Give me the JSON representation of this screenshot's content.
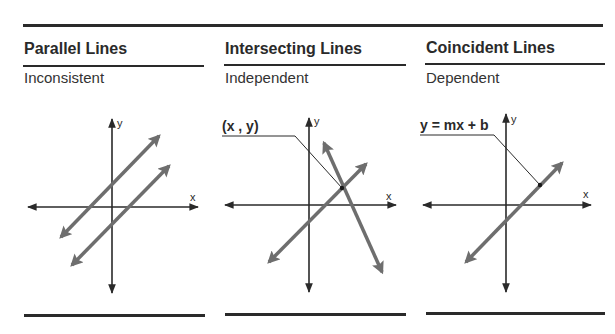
{
  "panels": [
    {
      "title": "Parallel Lines",
      "subtitle": "Inconsistent",
      "axis_labels": {
        "x": "x",
        "y": "y"
      }
    },
    {
      "title": "Intersecting Lines",
      "subtitle": "Independent",
      "axis_labels": {
        "x": "x",
        "y": "y"
      },
      "callout": "(x , y)"
    },
    {
      "title": "Coincident Lines",
      "subtitle": "Dependent",
      "axis_labels": {
        "x": "x",
        "y": "y"
      },
      "callout": "y = mx + b"
    }
  ],
  "colors": {
    "rule": "#2a2a2a",
    "axis": "#2a2a2a",
    "line": "#6e6e6e",
    "text": "#2a2a2a"
  }
}
